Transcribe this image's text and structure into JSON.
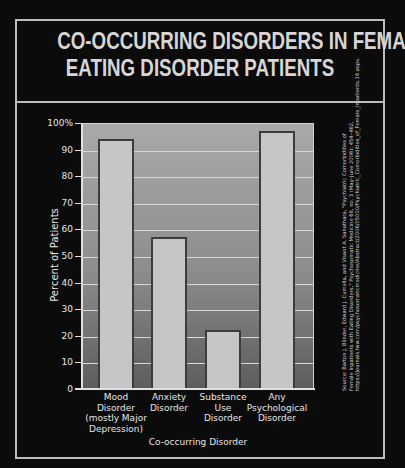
{
  "title_lines": [
    "CO-OCCURRING DISORDERS IN FEMALE",
    "EATING DISORDER PATIENTS"
  ],
  "chart_data": {
    "type": "bar",
    "title": "CO-OCCURRING DISORDERS IN FEMALE EATING DISORDER PATIENTS",
    "categories": [
      "Mood Disorder (mostly Major Depression)",
      "Anxiety Disorder",
      "Substance Use Disorder",
      "Any Psychological Disorder"
    ],
    "category_label_lines": [
      [
        "Mood",
        "Disorder",
        "(mostly Major",
        "Depression)"
      ],
      [
        "Anxiety",
        "Disorder"
      ],
      [
        "Substance",
        "Use",
        "Disorder"
      ],
      [
        "Any",
        "Psychological",
        "Disorder"
      ]
    ],
    "values": [
      94,
      57,
      22,
      97
    ],
    "xlabel": "Co-occurring Disorder",
    "ylabel": "Percent of Patients",
    "ylim": [
      0,
      100
    ],
    "yticks": [
      "0",
      "10",
      "20",
      "30",
      "40",
      "50",
      "60",
      "70",
      "80",
      "90",
      "100%"
    ],
    "grid": true,
    "legend": null,
    "source": "Source: Barton J. Blinder, Edward J. Cumella, and Visant A. Sanathara, \"Psychiatric Comorbidities of Female Inpatients with Eating Disorders,\" Psychosomatic Medicine 68, no. 3 (May–June 2006): 454–462, https://journals.lww.com/psychosomaticmedicine/Abstract/2006/05000/Psychiatric_Comorbidities_of_Female_Inpatients.14.aspx."
  },
  "colors": {
    "background": "#0b0b0b",
    "frame": "#bdbdbd",
    "bar_fill": "#c6c6c6",
    "bar_border": "#3c3c3c",
    "text": "#e6e6e6"
  }
}
